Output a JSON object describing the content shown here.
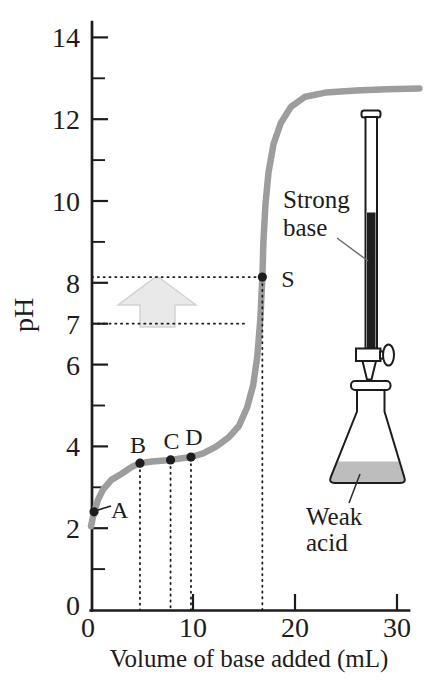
{
  "figure": {
    "background": "#ffffff",
    "description_visible_text_only": true
  },
  "chart_data": {
    "type": "line",
    "title": "",
    "xlabel": "Volume of base added (mL)",
    "ylabel": "pH",
    "xlim": [
      0,
      32
    ],
    "ylim": [
      0,
      14
    ],
    "grid": false,
    "x_ticks_labeled": [
      0,
      10,
      20,
      30
    ],
    "y_ticks_labeled": [
      0,
      2,
      4,
      6,
      7,
      8,
      10,
      12,
      14
    ],
    "y_ticks_minor": [
      1,
      3,
      5,
      9,
      11,
      13
    ],
    "curve": [
      [
        0,
        2.05
      ],
      [
        0.3,
        2.4
      ],
      [
        0.7,
        2.7
      ],
      [
        1.2,
        2.95
      ],
      [
        2,
        3.18
      ],
      [
        3,
        3.33
      ],
      [
        4,
        3.5
      ],
      [
        4.8,
        3.59
      ],
      [
        6,
        3.63
      ],
      [
        7.8,
        3.67
      ],
      [
        9.8,
        3.74
      ],
      [
        11,
        3.83
      ],
      [
        12.3,
        4.0
      ],
      [
        13.5,
        4.22
      ],
      [
        14.5,
        4.5
      ],
      [
        15.3,
        4.95
      ],
      [
        15.9,
        5.5
      ],
      [
        16.3,
        6.2
      ],
      [
        16.6,
        7.1
      ],
      [
        16.8,
        8.14
      ],
      [
        16.9,
        9.0
      ],
      [
        17.1,
        9.9
      ],
      [
        17.4,
        10.7
      ],
      [
        17.9,
        11.4
      ],
      [
        18.6,
        11.9
      ],
      [
        19.6,
        12.3
      ],
      [
        21,
        12.55
      ],
      [
        23,
        12.65
      ],
      [
        26,
        12.7
      ],
      [
        29,
        12.73
      ],
      [
        32.2,
        12.75
      ]
    ],
    "points": [
      {
        "label": "A",
        "vol": 0.3,
        "pH": 2.4,
        "guide": false,
        "anchor": "start",
        "dx": 17,
        "dy": 6
      },
      {
        "label": "B",
        "vol": 4.8,
        "pH": 3.59,
        "guide": true,
        "anchor": "middle",
        "dx": -2,
        "dy": -10
      },
      {
        "label": "C",
        "vol": 7.8,
        "pH": 3.67,
        "guide": true,
        "anchor": "middle",
        "dx": 1,
        "dy": -11
      },
      {
        "label": "D",
        "vol": 9.8,
        "pH": 3.74,
        "guide": true,
        "anchor": "middle",
        "dx": 3,
        "dy": -12
      },
      {
        "label": "S",
        "vol": 16.8,
        "pH": 8.14,
        "guide": true,
        "anchor": "start",
        "dx": 19,
        "dy": 10
      }
    ],
    "h_guides": [
      {
        "pH": 8.14,
        "to_ml": 16.2
      },
      {
        "pH": 7.0,
        "to_ml": 15.4
      }
    ]
  },
  "annotations": {
    "burette_label_line1": "Strong",
    "burette_label_line2": "base",
    "flask_label_line1": "Weak",
    "flask_label_line2": "acid"
  },
  "colors": {
    "ink": "#1c1c1c",
    "curve": "#9d9d9d",
    "arrow_fill": "#e9e9e9",
    "arrow_stroke": "#d2d2d2",
    "titrant": "#1e1e1e",
    "flask_liquid": "#bdbdbd"
  }
}
